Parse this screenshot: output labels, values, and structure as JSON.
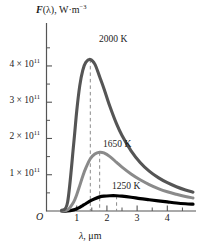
{
  "figure": {
    "name": "blackbody-spectral-distribution",
    "background": "#ffffff"
  },
  "axes": {
    "y_title_symbol": "F",
    "y_title_arg": "(λ), W·m",
    "y_title_exp": "−3",
    "x_title_symbol": "λ",
    "x_title_unit": ", μm",
    "origin_label": "O",
    "y_ticks": [
      {
        "value": 1,
        "label_mantissa": "1 × 10",
        "label_exp": "11"
      },
      {
        "value": 2,
        "label_mantissa": "2 × 10",
        "label_exp": "11"
      },
      {
        "value": 3,
        "label_mantissa": "3 × 10",
        "label_exp": "11"
      },
      {
        "value": 4,
        "label_mantissa": "4 × 10",
        "label_exp": "11"
      }
    ],
    "y_minor_ticks": [
      0.5,
      1.5,
      2.5,
      3.5,
      4.5
    ],
    "x_ticks": [
      {
        "value": 1,
        "label": "1"
      },
      {
        "value": 2,
        "label": "2"
      },
      {
        "value": 3,
        "label": "3"
      },
      {
        "value": 4,
        "label": "4"
      }
    ],
    "x_minor_ticks": [
      1.5,
      2.5,
      3.5,
      4.5
    ]
  },
  "annotations": [
    {
      "name": "label-2000k",
      "text": "2000 K",
      "x_px": 99,
      "y_px": 35
    },
    {
      "name": "label-1650k",
      "text": "1650 K",
      "x_px": 103,
      "y_px": 140
    },
    {
      "name": "label-1250k",
      "text": "1250 K",
      "x_px": 112,
      "y_px": 182
    }
  ],
  "colors": {
    "curve_2000k": "#555555",
    "curve_1650k": "#8a8a8a",
    "curve_1250k": "#000000",
    "axis": "#555555",
    "dashed_guide": "#8a8a8a",
    "text": "#1a1a1a"
  },
  "chart_data": {
    "type": "line",
    "title": "",
    "xlabel": "λ, μm",
    "ylabel": "F(λ), W·m⁻³",
    "xlim": [
      0,
      4.85
    ],
    "ylim": [
      0,
      4.55
    ],
    "y_scale_factor": 100000000000.0,
    "grid": false,
    "legend": "inline-annotations",
    "peak_guides": [
      {
        "series": "2000 K",
        "lambda_max_um": 1.45,
        "peak_value": 4.18
      },
      {
        "series": "1650 K",
        "lambda_max_um": 1.76,
        "peak_value": 1.62
      },
      {
        "series": "1250 K",
        "lambda_max_um": 2.32,
        "peak_value": 0.42
      }
    ],
    "x": [
      0.5,
      0.7,
      0.9,
      1.0,
      1.1,
      1.2,
      1.3,
      1.45,
      1.6,
      1.76,
      1.9,
      2.1,
      2.32,
      2.5,
      2.8,
      3.1,
      3.4,
      3.7,
      4.0,
      4.3,
      4.6,
      4.85
    ],
    "series": [
      {
        "name": "2000 K",
        "color": "#555555",
        "values": [
          0.02,
          0.25,
          1.85,
          2.75,
          3.45,
          3.88,
          4.1,
          4.18,
          4.05,
          3.7,
          3.38,
          2.88,
          2.4,
          2.08,
          1.66,
          1.34,
          1.1,
          0.92,
          0.78,
          0.67,
          0.58,
          0.52
        ]
      },
      {
        "name": "1650 K",
        "color": "#8a8a8a",
        "values": [
          0.0,
          0.03,
          0.25,
          0.45,
          0.7,
          0.96,
          1.18,
          1.44,
          1.57,
          1.62,
          1.6,
          1.5,
          1.34,
          1.21,
          1.02,
          0.86,
          0.73,
          0.62,
          0.53,
          0.46,
          0.4,
          0.36
        ]
      },
      {
        "name": "1250 K",
        "color": "#000000",
        "values": [
          0.0,
          0.0,
          0.03,
          0.06,
          0.1,
          0.15,
          0.2,
          0.28,
          0.34,
          0.39,
          0.41,
          0.42,
          0.42,
          0.41,
          0.38,
          0.34,
          0.31,
          0.28,
          0.25,
          0.22,
          0.2,
          0.19
        ]
      }
    ]
  }
}
